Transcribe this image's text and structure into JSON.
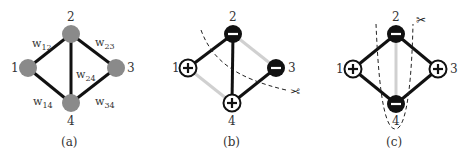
{
  "panels": [
    {
      "id": "a",
      "caption": "(a)",
      "nodes": [
        {
          "id": "1",
          "label": "1",
          "sign": "none"
        },
        {
          "id": "2",
          "label": "2",
          "sign": "none"
        },
        {
          "id": "3",
          "label": "3",
          "sign": "none"
        },
        {
          "id": "4",
          "label": "4",
          "sign": "none"
        }
      ],
      "edges": [
        {
          "from": "1",
          "to": "2",
          "weight": "w",
          "sub": "12",
          "style": "strong"
        },
        {
          "from": "2",
          "to": "3",
          "weight": "w",
          "sub": "23",
          "style": "strong"
        },
        {
          "from": "2",
          "to": "4",
          "weight": "w",
          "sub": "24",
          "style": "strong"
        },
        {
          "from": "1",
          "to": "4",
          "weight": "w",
          "sub": "14",
          "style": "strong"
        },
        {
          "from": "3",
          "to": "4",
          "weight": "w",
          "sub": "34",
          "style": "strong"
        }
      ]
    },
    {
      "id": "b",
      "caption": "(b)",
      "nodes": [
        {
          "id": "1",
          "label": "1",
          "sign": "+"
        },
        {
          "id": "2",
          "label": "2",
          "sign": "−"
        },
        {
          "id": "3",
          "label": "3",
          "sign": "−"
        },
        {
          "id": "4",
          "label": "4",
          "sign": "+"
        }
      ],
      "edges": [
        {
          "from": "1",
          "to": "2",
          "style": "strong"
        },
        {
          "from": "2",
          "to": "4",
          "style": "strong"
        },
        {
          "from": "3",
          "to": "4",
          "style": "strong"
        },
        {
          "from": "2",
          "to": "3",
          "style": "faint"
        },
        {
          "from": "1",
          "to": "4",
          "style": "faint"
        }
      ],
      "cut": {
        "shape": "curve",
        "icon": "scissors-icon",
        "glyph": "✂"
      }
    },
    {
      "id": "c",
      "caption": "(c)",
      "nodes": [
        {
          "id": "1",
          "label": "1",
          "sign": "+"
        },
        {
          "id": "2",
          "label": "2",
          "sign": "−"
        },
        {
          "id": "3",
          "label": "3",
          "sign": "+"
        },
        {
          "id": "4",
          "label": "4",
          "sign": "−"
        }
      ],
      "edges": [
        {
          "from": "1",
          "to": "2",
          "style": "strong"
        },
        {
          "from": "2",
          "to": "3",
          "style": "strong"
        },
        {
          "from": "1",
          "to": "4",
          "style": "strong"
        },
        {
          "from": "3",
          "to": "4",
          "style": "strong"
        },
        {
          "from": "2",
          "to": "4",
          "style": "faint"
        }
      ],
      "cut": {
        "shape": "u-loop",
        "icon": "scissors-icon",
        "glyph": "✂"
      }
    }
  ],
  "colors": {
    "node_gray": "#8a8a8a",
    "node_negative": "#111111",
    "node_positive": "#ffffff",
    "edge_strong": "#111111",
    "edge_faint": "#d0d0d0"
  }
}
